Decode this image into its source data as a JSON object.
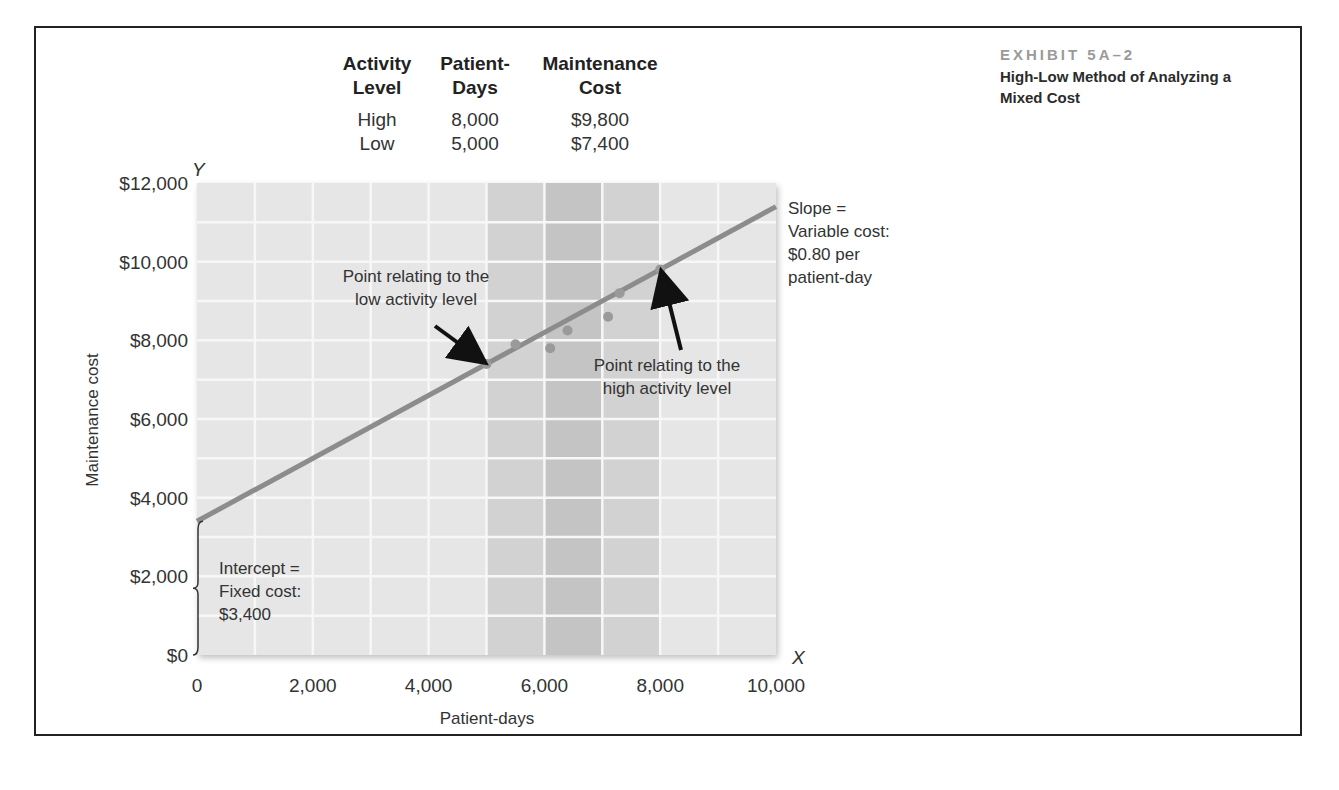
{
  "exhibit": {
    "label": "EXHIBIT 5A–2",
    "title_line1": "High-Low Method of Analyzing a",
    "title_line2": "Mixed Cost"
  },
  "table": {
    "headers": [
      {
        "line1": "Activity",
        "line2": "Level"
      },
      {
        "line1": "Patient-",
        "line2": "Days"
      },
      {
        "line1": "Maintenance",
        "line2": "Cost"
      }
    ],
    "rows": [
      {
        "level": "High",
        "days": "8,000",
        "cost": "$9,800"
      },
      {
        "level": "Low",
        "days": "5,000",
        "cost": "$7,400"
      }
    ]
  },
  "annotations": {
    "low_point": [
      "Point relating to the",
      "low activity level"
    ],
    "high_point": [
      "Point relating to the",
      "high activity level"
    ],
    "slope": [
      "Slope =",
      "Variable cost:",
      "$0.80 per",
      "patient-day"
    ],
    "intercept": [
      "Intercept =",
      "Fixed cost:",
      "$3,400"
    ]
  },
  "chart_data": {
    "type": "scatter",
    "title": "High-Low Method of Analyzing a Mixed Cost",
    "xlabel": "Patient-days",
    "ylabel": "Maintenance cost",
    "x_axis_letter": "X",
    "y_axis_letter": "Y",
    "xlim": [
      0,
      10000
    ],
    "ylim": [
      0,
      12000
    ],
    "x_ticks": [
      "0",
      "2,000",
      "4,000",
      "6,000",
      "8,000",
      "10,000"
    ],
    "y_ticks": [
      "$0",
      "$2,000",
      "$4,000",
      "$6,000",
      "$8,000",
      "$10,000",
      "$12,000"
    ],
    "grid": true,
    "highlight_band": [
      5000,
      8000
    ],
    "points": [
      {
        "x": 5000,
        "y": 7400,
        "label": "low"
      },
      {
        "x": 5500,
        "y": 7900
      },
      {
        "x": 6100,
        "y": 7800
      },
      {
        "x": 6400,
        "y": 8250
      },
      {
        "x": 7100,
        "y": 8600
      },
      {
        "x": 7300,
        "y": 9200
      },
      {
        "x": 8000,
        "y": 9800,
        "label": "high"
      }
    ],
    "line": {
      "intercept": 3400,
      "slope": 0.8,
      "x_start": 0,
      "x_end": 10000
    },
    "colors": {
      "plot_bg": "#e6e6e6",
      "band_light": "#d2d2d2",
      "band_dark": "#c4c4c4",
      "line": "#8c8c8c",
      "points": "#9a9a9a",
      "grid": "#f7f7f7"
    }
  }
}
